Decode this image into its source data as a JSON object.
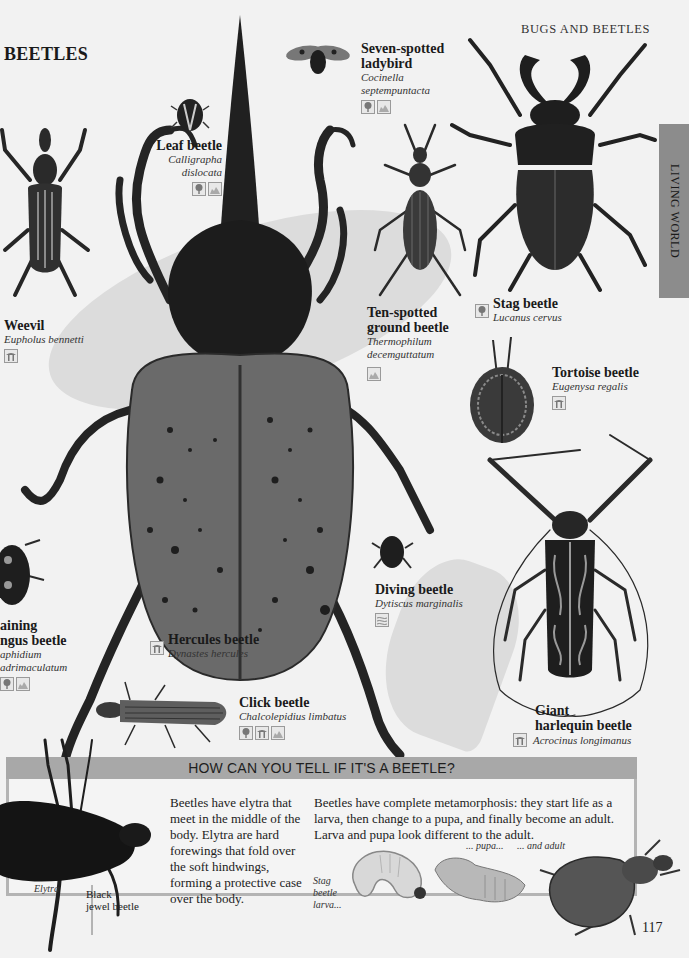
{
  "header": {
    "section_title": "BEETLES",
    "running_head": "BUGS AND BEETLES",
    "side_tab": "LIVING WORLD",
    "page_number": "117"
  },
  "species": [
    {
      "id": "weevil",
      "common": "Weevil",
      "latin": "Eupholus bennetti",
      "habitats": [
        "rainforest"
      ]
    },
    {
      "id": "leaf",
      "common": "Leaf beetle",
      "latin_lines": [
        "Calligrapha",
        "dislocata"
      ],
      "habitats": [
        "forest",
        "grassland"
      ]
    },
    {
      "id": "ladybird",
      "common_lines": [
        "Seven-spotted",
        "ladybird"
      ],
      "latin_lines": [
        "Cocinella",
        "septempuntacta"
      ],
      "habitats": [
        "forest",
        "grassland"
      ]
    },
    {
      "id": "ground",
      "common_lines": [
        "Ten-spotted",
        "ground beetle"
      ],
      "latin_lines": [
        "Thermophilum",
        "decemguttatum"
      ],
      "habitats": [
        "grassland"
      ]
    },
    {
      "id": "stag",
      "common": "Stag beetle",
      "latin": "Lucanus cervus",
      "habitats": [
        "forest"
      ]
    },
    {
      "id": "tortoise",
      "common": "Tortoise beetle",
      "latin": "Eugenysa regalis",
      "habitats": [
        "rainforest"
      ]
    },
    {
      "id": "hercules",
      "common": "Hercules beetle",
      "latin": "Dynastes hercules",
      "habitats": [
        "rainforest"
      ]
    },
    {
      "id": "diving",
      "common": "Diving beetle",
      "latin": "Dytiscus marginalis",
      "habitats": [
        "freshwater"
      ]
    },
    {
      "id": "fungus",
      "common_lines": [
        "aining",
        "ngus beetle"
      ],
      "latin_lines": [
        "aphidium",
        "adrimaculatum"
      ],
      "habitats": [
        "forest",
        "grassland"
      ]
    },
    {
      "id": "click",
      "common": "Click beetle",
      "latin": "Chalcolepidius limbatus",
      "habitats": [
        "forest",
        "rainforest",
        "grassland"
      ]
    },
    {
      "id": "harlequin",
      "common_lines": [
        "Giant",
        "harlequin beetle"
      ],
      "latin": "Acrocinus longimanus",
      "habitats": [
        "rainforest"
      ]
    }
  ],
  "panel": {
    "title": "HOW CAN YOU TELL IF IT'S A BEETLE?",
    "elytra_text": "Beetles have elytra that meet in the middle of the body. Elytra are hard forewings that fold over the soft hindwings, forming a protective case over the body.",
    "metamorphosis_text": "Beetles have complete metamorphosis: they start life as a larva, then change to a pupa, and finally become an adult. Larva and pupa look different to the adult.",
    "labels": {
      "elytra": "Elytra",
      "black_jewel": [
        "Black",
        "jewel beetle"
      ],
      "larva": [
        "Stag",
        "beetle",
        "larva..."
      ],
      "pupa": "... pupa...",
      "adult": "... and adult"
    }
  },
  "colors": {
    "page_bg": "#f2f2f2",
    "swoosh": "#dcdcdc",
    "panel_head": "#a8a8a8",
    "side_tab": "#8c8c8c",
    "beetle_dark": "#1e1e1e",
    "beetle_mid": "#5a5a5a"
  }
}
